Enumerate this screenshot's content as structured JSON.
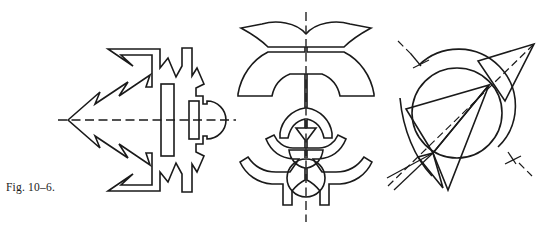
{
  "page": {
    "width": 548,
    "height": 232,
    "background_color": "#ffffff",
    "ink_color": "#1a1a1a",
    "caption": "Fig. 10–6."
  },
  "figure": {
    "label": "Fig. 10–6.",
    "kind": "line-art-plate",
    "panel_count": 3,
    "panels": [
      {
        "id": "panel-1",
        "name": "arrow-fish-shape",
        "symmetry": "horizontal",
        "axis_orientation": "horizontal",
        "axis_label": "horizontal-centerline",
        "features": [
          "left-pointing arrow head",
          "jagged zigzag body outline",
          "tall inner rectangle",
          "small inner rectangle",
          "circle at right end"
        ],
        "bounds": {
          "x": 60,
          "y": 40,
          "width": 180,
          "height": 140
        }
      },
      {
        "id": "panel-2",
        "name": "winged-ornament-shape",
        "symmetry": "vertical",
        "axis_orientation": "vertical",
        "axis_label": "vertical-centerline",
        "features": [
          "upper swept wings",
          "mid curved arms",
          "inner triangle notch",
          "lower flared base",
          "circle on axis at base"
        ],
        "bounds": {
          "x": 228,
          "y": 14,
          "width": 156,
          "height": 196
        }
      },
      {
        "id": "panel-3",
        "name": "circle-and-wedge-shape",
        "symmetry": "diagonal",
        "axis_orientation": "diagonal",
        "axis_label": "inclined-centerline",
        "features": [
          "full circle",
          "concentric outer arc",
          "upper-right triangular wedge",
          "lower-left triangular wedge",
          "radiating straight lines",
          "two perpendicular tick marks on axis"
        ],
        "bounds": {
          "x": 385,
          "y": 22,
          "width": 160,
          "height": 168
        }
      }
    ]
  }
}
